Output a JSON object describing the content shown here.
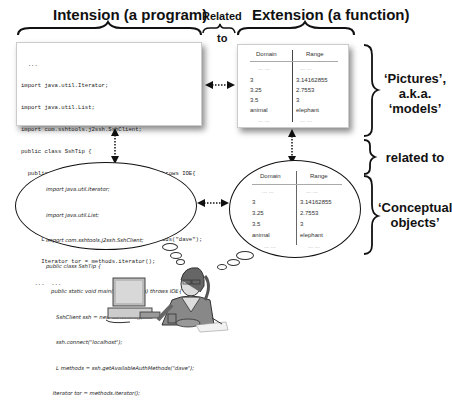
{
  "headers": {
    "intension": "Intension (a program)",
    "related_top_1": "Related",
    "related_top_2": "to",
    "extension": "Extension (a function)"
  },
  "side_labels": {
    "pictures_1": "‘Pictures’,",
    "pictures_2": "a.k.a.",
    "pictures_3": "‘models’",
    "related": "related to",
    "conceptual_1": "‘Conceptual",
    "conceptual_2": "objects’"
  },
  "program": {
    "lines": [
      "  ...",
      "import java.util.Iterator;",
      "import java.util.List;",
      "import com.sshtools.j2ssh.SshClient;",
      "public class SshTip {",
      "  public static void main(String[] args) throws IOE{",
      "      SshClient ssh = new SshClient();",
      "      ssh.connect(\"localhost\");",
      "      L methods = ssh.getAvailableAuthMethods(\"dave\");",
      "      Iterator tor = methods.iterator();",
      "    ...  ..."
    ]
  },
  "thought_program": {
    "lines": [
      "import java.util.Iterator;",
      "import java.util.List;",
      "import com.sshtools.j2ssh.SshClient;",
      "public class SshTip {",
      "   public static void main(String[] args) throws IOE{",
      "      SshClient ssh = new SshClient();",
      "      ssh.connect(\"localhost\");",
      "      L methods = ssh.getAvailableAuthMethods(\"dave\");",
      "    Iterator tor = methods.iterator();"
    ]
  },
  "function_table": {
    "headers": [
      "Domain",
      "Range"
    ],
    "rows": [
      [
        "... ...",
        "... ..."
      ],
      [
        "3",
        "3.14162855"
      ],
      [
        "3.25",
        "2.7553"
      ],
      [
        "3.5",
        "3"
      ],
      [
        "animal",
        "elephant"
      ],
      [
        "... ...",
        "... ..."
      ]
    ]
  }
}
